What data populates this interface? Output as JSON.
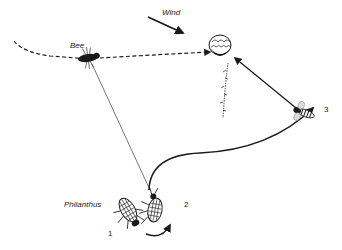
{
  "labels": {
    "wind": "Wind",
    "bee": "Bee",
    "philanthus": "Philanthus"
  },
  "positions": {
    "p1": "1",
    "p2": "2",
    "p3": "3"
  },
  "colors": {
    "ink": "#1a1a1a",
    "background": "#ffffff"
  }
}
